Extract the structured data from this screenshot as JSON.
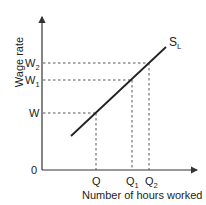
{
  "diagram": {
    "y_axis_label": "Wage rate",
    "x_axis_label": "Number of hours worked",
    "origin_label": "0",
    "curve_label": {
      "main": "S",
      "sub": "L"
    },
    "y_ticks": [
      {
        "main": "W",
        "sub": "2"
      },
      {
        "main": "W",
        "sub": "1"
      },
      {
        "main": "W",
        "sub": ""
      }
    ],
    "x_ticks": [
      {
        "main": "Q",
        "sub": ""
      },
      {
        "main": "Q",
        "sub": "1"
      },
      {
        "main": "Q",
        "sub": "2"
      }
    ],
    "colors": {
      "line": "#222222",
      "dashed": "#555555",
      "axis": "#333333"
    }
  }
}
